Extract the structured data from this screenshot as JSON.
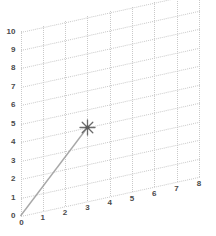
{
  "chart_data": {
    "type": "line",
    "title": "",
    "xlabel": "",
    "ylabel": "",
    "xlim": [
      0,
      8
    ],
    "ylim": [
      0,
      10
    ],
    "grid": true,
    "grid_style": "dotted",
    "legend": "none",
    "projection": "sheared-2d",
    "xticks": [
      "0",
      "1",
      "2",
      "3",
      "4",
      "5",
      "6",
      "7",
      "8"
    ],
    "yticks": [
      "0",
      "1",
      "2",
      "3",
      "4",
      "5",
      "6",
      "7",
      "8",
      "9",
      "10"
    ],
    "series": [
      {
        "name": "segment",
        "marker": "star",
        "line_color": "#a8a8a8",
        "marker_color": "#6b6b6b",
        "x": [
          0,
          3
        ],
        "y": [
          0,
          4
        ]
      }
    ],
    "annotations": []
  },
  "colors": {
    "grid": "#c9c9c9",
    "tick_text": "#4a4a4a",
    "line": "#a8a8a8",
    "marker": "#6b6b6b",
    "background": "#ffffff"
  },
  "marker_label": "star-marker"
}
